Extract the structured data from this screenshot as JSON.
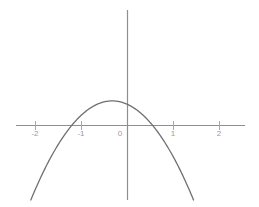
{
  "chart_data": {
    "type": "line",
    "title": "",
    "subtitle": "",
    "xlabel": "",
    "ylabel": "",
    "function": "y = -3x^2 - 2x + 1",
    "curve_description": "downward-opening parabola",
    "xlim": [
      -2.45,
      2.6
    ],
    "ylim": [
      -3.15,
      1.25
    ],
    "axis_ticks_x": [
      -2,
      -1,
      0,
      1,
      2
    ],
    "axis_ticks_y": [],
    "grid": false,
    "legend": null,
    "vertex": [
      -0.333,
      1.0
    ],
    "x_intercepts": [
      -1.215,
      0.548
    ],
    "y_intercept": 0.73,
    "x": [
      -1.38,
      -1.3,
      -1.2,
      -1.1,
      -1.0,
      -0.9,
      -0.8,
      -0.7,
      -0.6,
      -0.5,
      -0.4,
      -0.333,
      -0.25,
      -0.1,
      0.0,
      0.15,
      0.3,
      0.45,
      0.6,
      0.75,
      0.9,
      0.9
    ],
    "y": [
      -3.04,
      -2.47,
      -1.72,
      -1.03,
      -0.4,
      0.17,
      0.68,
      1.13,
      1.52,
      1.85,
      2.12,
      2.22,
      2.1,
      1.5,
      0.73,
      -0.18,
      -1.12,
      -2.07,
      -3.04,
      -4.04,
      -5.05,
      -5.05
    ],
    "tick_labels": {
      "neg2": "-2",
      "neg1": "-1",
      "zero": "0",
      "pos1": "1",
      "pos2": "2"
    },
    "colors": {
      "curve": "#6f6f6f",
      "axis": "#8f8f8f",
      "tick": "#a8a8a8",
      "label": "#a0a0a0",
      "background": "#ffffff"
    }
  }
}
